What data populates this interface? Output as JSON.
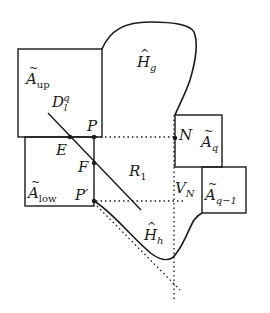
{
  "figure": {
    "type": "geometric diagram",
    "regions": {
      "a_up": {
        "base": "A",
        "accent": "tilde",
        "sub": "up"
      },
      "a_low": {
        "base": "A",
        "accent": "tilde",
        "sub": "low"
      },
      "a_q": {
        "base": "A",
        "accent": "tilde",
        "sub": "q"
      },
      "a_q1": {
        "base": "A",
        "accent": "tilde",
        "sub": "q−1"
      },
      "h_g": {
        "base": "H",
        "accent": "hat",
        "sub": "g"
      },
      "h_h": {
        "base": "H",
        "accent": "hat",
        "sub": "h"
      },
      "r1": {
        "base": "R",
        "sub": "1"
      }
    },
    "points": {
      "p": "P",
      "p_prime": "P′",
      "e": "E",
      "f": "F",
      "n": "N"
    },
    "line": {
      "base": "D",
      "sub": "l",
      "sup": "q"
    },
    "vline": {
      "base": "V",
      "sub": "N"
    },
    "colors": {
      "stroke": "#1a1a1a",
      "background": "#ffffff"
    }
  }
}
